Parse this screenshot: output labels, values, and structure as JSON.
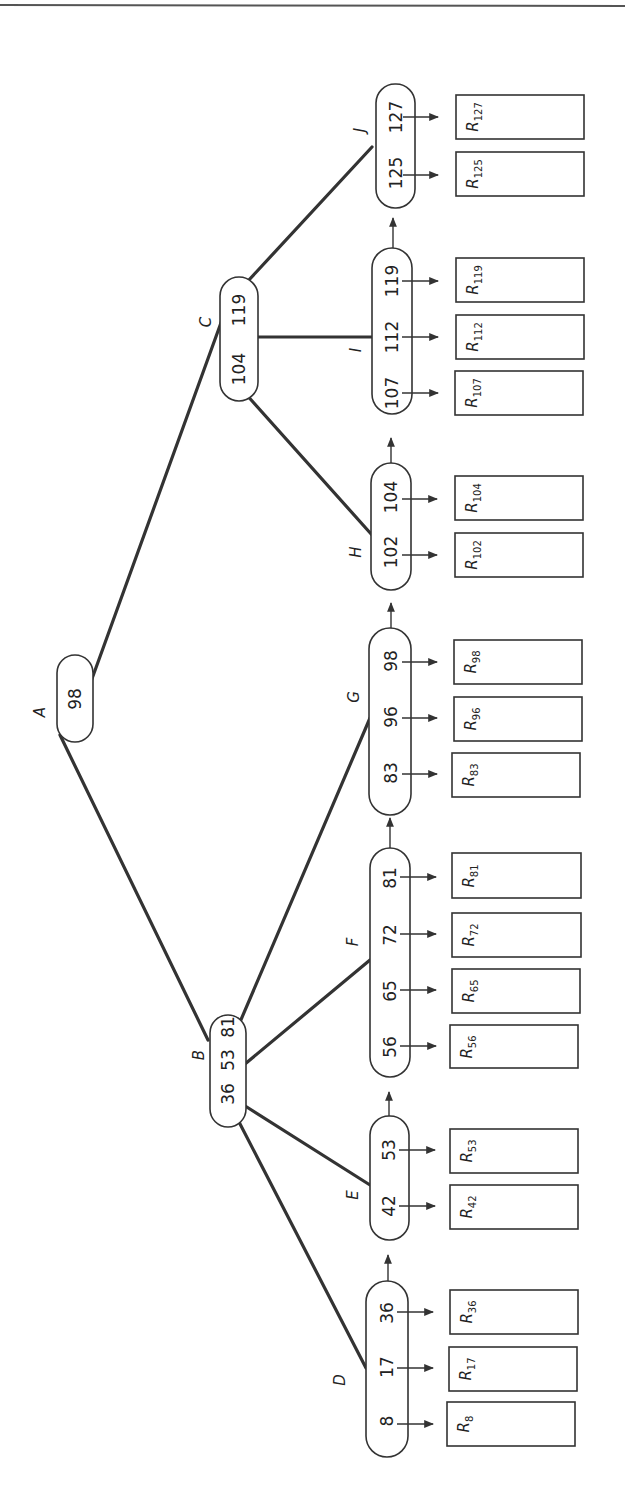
{
  "diagram": {
    "type": "B+ tree",
    "orientation": "rotated 90 degrees counter-clockwise",
    "root": {
      "label": "A",
      "keys": [
        "98"
      ]
    },
    "internal_nodes": [
      {
        "label": "B",
        "keys": [
          "36",
          "53",
          "81"
        ],
        "children": [
          "D",
          "E",
          "F",
          "G"
        ]
      },
      {
        "label": "C",
        "keys": [
          "104",
          "119"
        ],
        "children": [
          "H",
          "I",
          "J"
        ]
      }
    ],
    "leaf_nodes": [
      {
        "label": "D",
        "keys": [
          "8",
          "17",
          "36"
        ],
        "records": [
          "8",
          "17",
          "36"
        ]
      },
      {
        "label": "E",
        "keys": [
          "42",
          "53"
        ],
        "records": [
          "42",
          "53"
        ]
      },
      {
        "label": "F",
        "keys": [
          "56",
          "65",
          "72",
          "81"
        ],
        "records": [
          "56",
          "65",
          "72",
          "81"
        ]
      },
      {
        "label": "G",
        "keys": [
          "83",
          "96",
          "98"
        ],
        "records": [
          "83",
          "96",
          "98"
        ]
      },
      {
        "label": "H",
        "keys": [
          "102",
          "104"
        ],
        "records": [
          "102",
          "104"
        ]
      },
      {
        "label": "I",
        "keys": [
          "107",
          "112",
          "119"
        ],
        "records": [
          "107",
          "112",
          "119"
        ]
      },
      {
        "label": "J",
        "keys": [
          "125",
          "127"
        ],
        "records": [
          "125",
          "127"
        ]
      }
    ],
    "record_prefix": "R",
    "edges": [
      [
        "A",
        "B"
      ],
      [
        "A",
        "C"
      ],
      [
        "B",
        "D"
      ],
      [
        "B",
        "E"
      ],
      [
        "B",
        "F"
      ],
      [
        "B",
        "G"
      ],
      [
        "C",
        "H"
      ],
      [
        "C",
        "I"
      ],
      [
        "C",
        "J"
      ]
    ],
    "leaf_links": [
      [
        "D",
        "E"
      ],
      [
        "E",
        "F"
      ],
      [
        "F",
        "G"
      ],
      [
        "G",
        "H"
      ],
      [
        "H",
        "I"
      ],
      [
        "I",
        "J"
      ]
    ]
  },
  "nodes": {
    "A": {
      "label": "A",
      "k0": "98"
    },
    "B": {
      "label": "B",
      "k0": "36",
      "k1": "53",
      "k2": "81"
    },
    "C": {
      "label": "C",
      "k0": "104",
      "k1": "119"
    },
    "D": {
      "label": "D",
      "k0": "8",
      "k1": "17",
      "k2": "36"
    },
    "E": {
      "label": "E",
      "k0": "42",
      "k1": "53"
    },
    "F": {
      "label": "F",
      "k0": "56",
      "k1": "65",
      "k2": "72",
      "k3": "81"
    },
    "G": {
      "label": "G",
      "k0": "83",
      "k1": "96",
      "k2": "98"
    },
    "H": {
      "label": "H",
      "k0": "102",
      "k1": "104"
    },
    "I": {
      "label": "I",
      "k0": "107",
      "k1": "112",
      "k2": "119"
    },
    "J": {
      "label": "J",
      "k0": "125",
      "k1": "127"
    }
  },
  "records": {
    "prefix": "R",
    "r8": "8",
    "r17": "17",
    "r36": "36",
    "r42": "42",
    "r53": "53",
    "r56": "56",
    "r65": "65",
    "r72": "72",
    "r81": "81",
    "r83": "83",
    "r96": "96",
    "r98": "98",
    "r102": "102",
    "r104": "104",
    "r107": "107",
    "r112": "112",
    "r119": "119",
    "r125": "125",
    "r127": "127"
  }
}
